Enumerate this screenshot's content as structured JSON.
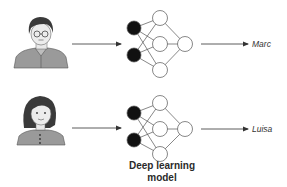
{
  "diagram": {
    "model_caption_line1": "Deep learning",
    "model_caption_line2": "model",
    "rows": [
      {
        "person": "man-with-glasses",
        "output_label": "Marc"
      },
      {
        "person": "woman",
        "output_label": "Luisa"
      }
    ],
    "network": {
      "input_nodes": 2,
      "hidden_nodes": 3,
      "output_nodes": 1,
      "input_fill": "#111111",
      "node_fill": "#ffffff",
      "edge_color": "#555555"
    },
    "colors": {
      "shirt": "#9a9a9a",
      "hair": "#3a3a3a",
      "skin": "#e8e8e8",
      "arrow": "#333333"
    }
  }
}
